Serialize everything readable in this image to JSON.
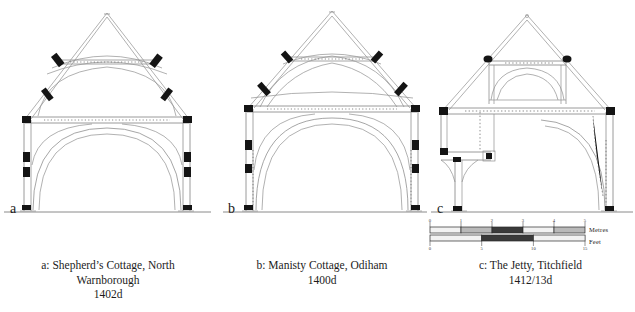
{
  "figure": {
    "title_implicit": "Cross-sections of three medieval timber-framed buildings",
    "line_color": "#8c8c8c",
    "joint_color": "#1a1a1a",
    "background": "#ffffff"
  },
  "panels": [
    {
      "letter": "a",
      "name": "shepherds-cottage-north-warnborough",
      "caption_lines": [
        "a: Shepherd’s Cottage, North",
        "Warnborough",
        "1402d"
      ],
      "caption_text": "a: Shepherd’s Cottage, North Warnborough 1402d",
      "building": "Shepherd’s Cottage",
      "place": "North Warnborough",
      "date": "1402d",
      "frame_type": "base-cruck / arch-braced open hall truss",
      "features": [
        "steep gable roof",
        "collar beam with pegged joints",
        "arched tie-beam",
        "arch braces to wall posts",
        "mortise-and-tenon joints shown solid black",
        "ground line with post bases"
      ]
    },
    {
      "letter": "b",
      "name": "manisty-cottage-odiham",
      "caption_lines": [
        "b: Manisty Cottage, Odiham",
        "1400d"
      ],
      "caption_text": "b: Manisty Cottage, Odiham 1400d",
      "building": "Manisty Cottage",
      "place": "Odiham",
      "date": "1400d",
      "frame_type": "base-cruck truss with high collar",
      "features": [
        "tall steep roof",
        "curved base-cruck blades",
        "collar with pegged joints",
        "full-height arch braces",
        "ground line with post bases"
      ]
    },
    {
      "letter": "c",
      "name": "the-jetty-titchfield",
      "caption_lines": [
        "c: The Jetty, Titchfield",
        "1412/13d"
      ],
      "caption_text": "c: The Jetty, Titchfield 1412/13d",
      "building": "The Jetty",
      "place": "Titchfield",
      "date": "1412/13d",
      "frame_type": "crown-post / queen-post truss with jettied floor",
      "features": [
        "queen struts to collar",
        "arched collar bracing",
        "tie beam at wall-plate level",
        "jettied first floor with curved bracket on left",
        "ground line with post bases"
      ]
    }
  ],
  "scalebar": {
    "name": "dual-metric-imperial-scale-bar",
    "metres": {
      "label": "Metres",
      "ticks": [
        "0",
        "1",
        "2",
        "3",
        "4",
        "5"
      ],
      "range": [
        0,
        5
      ],
      "unit": "m"
    },
    "feet": {
      "label": "Feet",
      "ticks": [
        "0",
        "5",
        "10",
        "15"
      ],
      "range": [
        0,
        15
      ],
      "unit": "ft"
    }
  }
}
